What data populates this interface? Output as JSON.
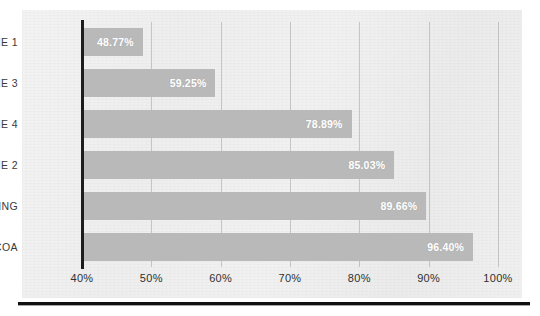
{
  "chart_data": {
    "type": "bar",
    "orientation": "horizontal",
    "title": "",
    "subtitle": "",
    "xlabel": "",
    "ylabel": "",
    "categories": [
      "LINE 1",
      "LINE 3",
      "LINE 4",
      "LINE 2",
      "PACKING",
      "COCOA"
    ],
    "values": [
      48.77,
      59.25,
      78.89,
      85.03,
      89.66,
      96.4
    ],
    "value_labels": [
      "48.77%",
      "59.25%",
      "78.89%",
      "85.03%",
      "89.66%",
      "96.40%"
    ],
    "xlim": [
      40,
      100
    ],
    "xticks": [
      40,
      50,
      60,
      70,
      80,
      90,
      100
    ],
    "xtick_labels": [
      "40%",
      "50%",
      "60%",
      "70%",
      "80%",
      "90%",
      "100%"
    ],
    "grid": "vertical-only",
    "legend": "none",
    "series": [
      {
        "name": "Performance",
        "values": [
          48.77,
          59.25,
          78.89,
          85.03,
          89.66,
          96.4
        ]
      }
    ],
    "bars": [
      {
        "category": "LINE 1",
        "value": 48.77,
        "label": "48.77%"
      },
      {
        "category": "LINE 3",
        "value": 59.25,
        "label": "59.25%"
      },
      {
        "category": "LINE 4",
        "value": 78.89,
        "label": "78.89%"
      },
      {
        "category": "LINE 2",
        "value": 85.03,
        "label": "85.03%"
      },
      {
        "category": "PACKING",
        "value": 89.66,
        "label": "89.66%"
      },
      {
        "category": "COCOA",
        "value": 96.4,
        "label": "96.40%"
      }
    ]
  },
  "colors": {
    "bar": "#b9b9b9",
    "bar_value_text": "#ffffff",
    "category_text": "#3a3a3a",
    "tick_text": "#303030",
    "axis_line": "#1d1d1d",
    "gridline": "#8c8c8c",
    "page_background": "#f0f0f0",
    "page_rule": "#111111"
  },
  "background_bleed": {
    "line_1": "",
    "line_2": "",
    "line_3": "",
    "line_4": ""
  }
}
